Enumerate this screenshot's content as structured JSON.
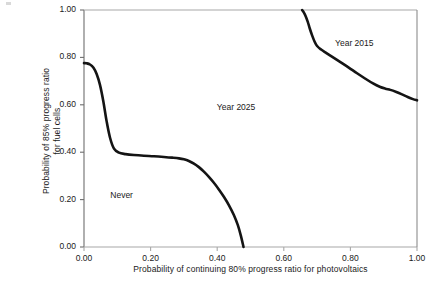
{
  "chart_data": {
    "type": "line",
    "title": "",
    "xlabel": "Probability of continuing 80% progress ratio for photovoltaics",
    "ylabel_line1": "Probability of 85% progress ratio",
    "ylabel_line2": "for fuel cells",
    "xlim": [
      0.0,
      1.0
    ],
    "ylim": [
      0.0,
      1.0
    ],
    "grid": false,
    "legend_position": "inline-annotations",
    "xticks": [
      "0.00",
      "0.20",
      "0.40",
      "0.60",
      "0.80",
      "1.00"
    ],
    "xtick_values": [
      0.0,
      0.2,
      0.4,
      0.6,
      0.8,
      1.0
    ],
    "yticks": [
      "0.00",
      "0.20",
      "0.40",
      "0.60",
      "0.80",
      "1.00"
    ],
    "ytick_values": [
      0.0,
      0.2,
      0.4,
      0.6,
      0.8,
      1.0
    ],
    "line_color": "#141414",
    "line_width": 2.6,
    "series": [
      {
        "name": "boundary-never-2025",
        "x": [
          0.0,
          0.008,
          0.018,
          0.028,
          0.038,
          0.048,
          0.058,
          0.068,
          0.078,
          0.09,
          0.105,
          0.125,
          0.15,
          0.18,
          0.21,
          0.24,
          0.265,
          0.285,
          0.3,
          0.315,
          0.33,
          0.345,
          0.36,
          0.375,
          0.39,
          0.405,
          0.42,
          0.435,
          0.45,
          0.462,
          0.471,
          0.479
        ],
        "y": [
          0.776,
          0.775,
          0.77,
          0.757,
          0.73,
          0.684,
          0.615,
          0.53,
          0.462,
          0.415,
          0.398,
          0.392,
          0.388,
          0.385,
          0.383,
          0.38,
          0.377,
          0.374,
          0.37,
          0.363,
          0.352,
          0.337,
          0.318,
          0.296,
          0.271,
          0.243,
          0.212,
          0.177,
          0.135,
          0.092,
          0.048,
          0.0
        ]
      },
      {
        "name": "boundary-2025-2015",
        "x": [
          0.655,
          0.66,
          0.666,
          0.672,
          0.678,
          0.685,
          0.692,
          0.7,
          0.712,
          0.728,
          0.748,
          0.77,
          0.795,
          0.82,
          0.845,
          0.868,
          0.888,
          0.905,
          0.92,
          0.938,
          0.955,
          0.972,
          0.988,
          1.0
        ],
        "y": [
          1.0,
          0.99,
          0.973,
          0.95,
          0.922,
          0.893,
          0.868,
          0.848,
          0.833,
          0.818,
          0.8,
          0.78,
          0.757,
          0.733,
          0.71,
          0.69,
          0.676,
          0.668,
          0.663,
          0.654,
          0.644,
          0.633,
          0.624,
          0.619
        ]
      }
    ],
    "annotations": [
      {
        "text": "Never",
        "x": 0.145,
        "y": 0.215
      },
      {
        "text": "Year 2025",
        "x": 0.465,
        "y": 0.588
      },
      {
        "text": "Year 2015",
        "x": 0.82,
        "y": 0.855
      }
    ]
  }
}
